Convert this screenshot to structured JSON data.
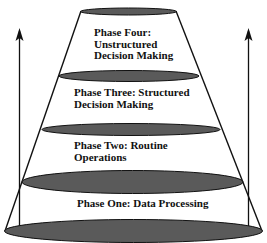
{
  "diagram": {
    "type": "stacked-cone",
    "colors": {
      "ellipse_fill": "#5a5a5a",
      "stroke": "#111111",
      "background": "#ffffff"
    },
    "phases": [
      {
        "id": "phase-four",
        "lines": [
          "Phase Four:",
          "Unstructured",
          "Decision Making"
        ]
      },
      {
        "id": "phase-three",
        "lines": [
          "Phase Three:  Structured",
          "Decision Making"
        ]
      },
      {
        "id": "phase-two",
        "lines": [
          "Phase Two:  Routine",
          "Operations"
        ]
      },
      {
        "id": "phase-one",
        "lines": [
          "Phase One:  Data Processing"
        ]
      }
    ],
    "arrows": [
      {
        "side": "left",
        "direction": "up"
      },
      {
        "side": "right",
        "direction": "up"
      }
    ]
  }
}
